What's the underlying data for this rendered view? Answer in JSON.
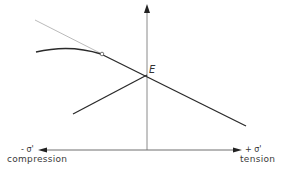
{
  "diagram": {
    "axes": {
      "x_negative": {
        "symbol": "- σ'",
        "caption": "compression"
      },
      "x_positive": {
        "symbol": "+ σ'",
        "caption": "tension"
      }
    },
    "points": {
      "E": "E"
    },
    "colors": {
      "axis": "#6e6e6e",
      "line": "#2a2a2a",
      "extension": "#a8a8a8",
      "text": "#333333"
    }
  }
}
